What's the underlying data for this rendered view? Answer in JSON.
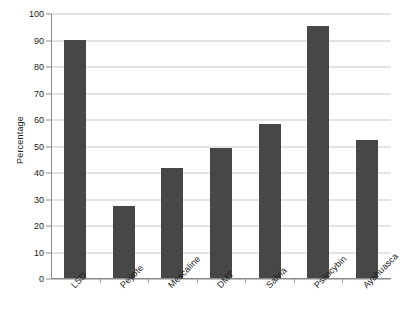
{
  "chart_data": {
    "type": "bar",
    "title": "",
    "xlabel": "",
    "ylabel": "Percentage",
    "categories": [
      "LSD",
      "Peyote",
      "Mescaline",
      "DMT",
      "Salvia",
      "Psilocybin",
      "Ayahuasca"
    ],
    "values": [
      90,
      27,
      41.5,
      49,
      58,
      95,
      52
    ],
    "ylim": [
      0,
      100
    ],
    "ytick_step": 10,
    "yticks": [
      0,
      10,
      20,
      30,
      40,
      50,
      60,
      70,
      80,
      90,
      100
    ],
    "ytick_labels": [
      "0",
      "10",
      "20",
      "30",
      "40",
      "50",
      "60",
      "70",
      "80",
      "90",
      "100"
    ],
    "grid": true,
    "grid_axis": "y",
    "legend": false,
    "legend_position": "none",
    "bar_color": "#474747",
    "gridline_color": "#c9c9c9",
    "axis_color": "#8a8a8a",
    "text_color": "#1a1a1a",
    "xtick_label_rotation": -45,
    "series": [
      {
        "name": "Percentage",
        "values": [
          90,
          27,
          41.5,
          49,
          58,
          95,
          52
        ]
      }
    ]
  }
}
